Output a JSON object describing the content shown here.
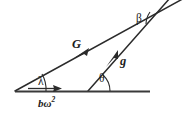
{
  "figure": {
    "type": "vector-diagram",
    "background_color": "#ffffff",
    "line_color": "#2b2b2b",
    "width": 186,
    "height": 116
  },
  "labels": {
    "gravitation_vector": "G",
    "gravity_vector": "g",
    "angle_lambda": "λ",
    "angle_theta": "θ",
    "angle_beta": "β",
    "centrifugal_base": "bω",
    "centrifugal_exponent": "2"
  },
  "geometry": {
    "baseline": {
      "x1": 15,
      "y1": 91,
      "x2": 150,
      "y2": 91
    },
    "G_line": {
      "x1": 15,
      "y1": 91,
      "x2": 186,
      "y2": -2
    },
    "g_line": {
      "x1": 88,
      "y1": 91,
      "x2": 168,
      "y2": 0
    },
    "G_arrow_at": {
      "x": 80,
      "y": 55
    },
    "g_arrow_at": {
      "x": 112,
      "y": 58
    },
    "bw_arrow": {
      "x1": 28,
      "y1": 89,
      "x2": 58,
      "y2": 89
    },
    "vertex_lambda": {
      "x": 15,
      "y": 91
    },
    "vertex_theta": {
      "x": 88,
      "y": 91
    },
    "vertex_beta": {
      "x": 160,
      "y": 13
    }
  }
}
